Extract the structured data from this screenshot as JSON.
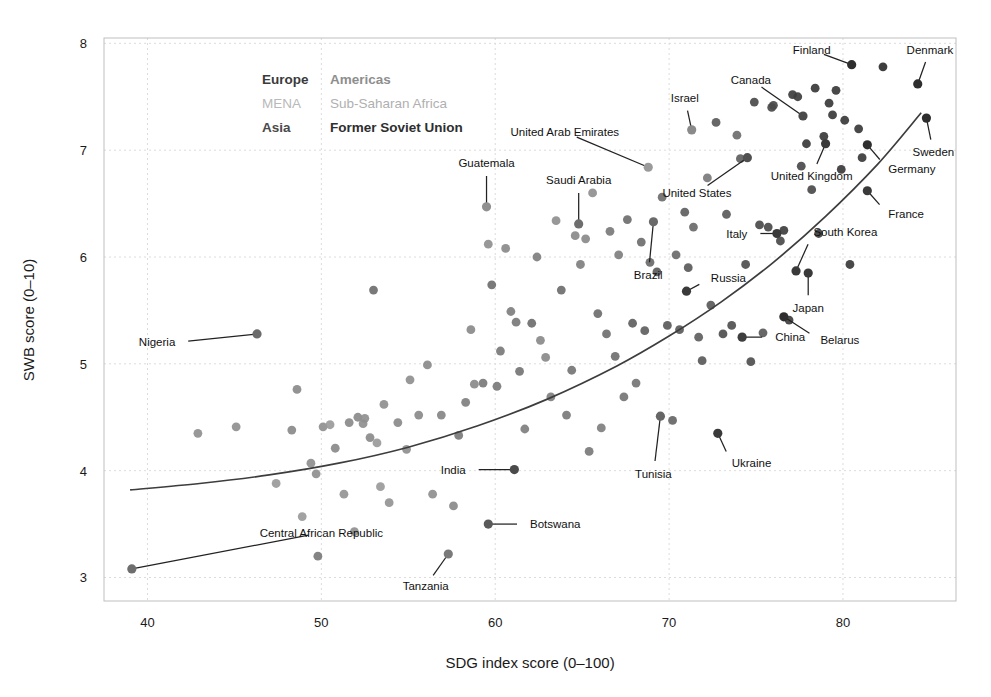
{
  "chart_data": {
    "type": "scatter",
    "title": "",
    "xlabel": "SDG index score (0–100)",
    "ylabel": "SWB score (0–10)",
    "xlim": [
      37.5,
      86.5
    ],
    "ylim": [
      2.78,
      8.05
    ],
    "xticks": [
      40,
      50,
      60,
      70,
      80
    ],
    "yticks": [
      3,
      4,
      5,
      6,
      7,
      8
    ],
    "grid": true,
    "legend_position": "inside-top-left",
    "legend": [
      {
        "label": "Europe",
        "color": "#3a3a3a"
      },
      {
        "label": "Americas",
        "color": "#8e8e8e"
      },
      {
        "label": "MENA",
        "color": "#b9b9b9"
      },
      {
        "label": "Sub-Saharan Africa",
        "color": "#b0b0b0"
      },
      {
        "label": "Asia",
        "color": "#4a4a4a"
      },
      {
        "label": "Former Soviet Union",
        "color": "#2e2e2e"
      }
    ],
    "trend": {
      "name": "fitted trend curve",
      "color": "#3d3d3d",
      "points": [
        [
          39.0,
          3.82
        ],
        [
          43.0,
          3.88
        ],
        [
          47.0,
          3.96
        ],
        [
          51.0,
          4.07
        ],
        [
          55.0,
          4.22
        ],
        [
          59.0,
          4.42
        ],
        [
          63.0,
          4.67
        ],
        [
          67.0,
          4.98
        ],
        [
          70.0,
          5.26
        ],
        [
          73.0,
          5.58
        ],
        [
          76.0,
          5.95
        ],
        [
          79.0,
          6.38
        ],
        [
          82.0,
          6.87
        ],
        [
          84.5,
          7.35
        ]
      ]
    },
    "labeled_points": [
      {
        "name": "Central African Republic",
        "x": 39.1,
        "y": 3.08,
        "color": "#6e6e6e",
        "label_x": 50.0,
        "label_y": 3.42,
        "anchor": "middle"
      },
      {
        "name": "Nigeria",
        "x": 46.3,
        "y": 5.28,
        "color": "#6b6b6b",
        "label_x": 41.6,
        "label_y": 5.2,
        "anchor": "end"
      },
      {
        "name": "Tanzania",
        "x": 57.3,
        "y": 3.22,
        "color": "#7a7a7a",
        "label_x": 56.0,
        "label_y": 2.92,
        "anchor": "middle"
      },
      {
        "name": "Botswana",
        "x": 59.6,
        "y": 3.5,
        "color": "#5a5a5a",
        "label_x": 62.0,
        "label_y": 3.5,
        "anchor": "start"
      },
      {
        "name": "India",
        "x": 61.1,
        "y": 4.01,
        "color": "#4a4a4a",
        "label_x": 58.3,
        "label_y": 4.01,
        "anchor": "end"
      },
      {
        "name": "Guatemala",
        "x": 59.5,
        "y": 6.47,
        "color": "#909090",
        "label_x": 59.5,
        "label_y": 6.88,
        "anchor": "middle"
      },
      {
        "name": "Saudi Arabia",
        "x": 64.8,
        "y": 6.31,
        "color": "#6e6e6e",
        "label_x": 64.8,
        "label_y": 6.72,
        "anchor": "middle"
      },
      {
        "name": "United Arab Emirates",
        "x": 68.8,
        "y": 6.84,
        "color": "#9a9a9a",
        "label_x": 64.0,
        "label_y": 7.17,
        "anchor": "middle"
      },
      {
        "name": "Israel",
        "x": 71.3,
        "y": 7.19,
        "color": "#8a8a8a",
        "label_x": 70.9,
        "label_y": 7.49,
        "anchor": "middle"
      },
      {
        "name": "United States",
        "x": 74.5,
        "y": 6.93,
        "color": "#505050",
        "label_x": 71.6,
        "label_y": 6.6,
        "anchor": "middle"
      },
      {
        "name": "Brazil",
        "x": 69.1,
        "y": 6.33,
        "color": "#6a6a6a",
        "label_x": 68.8,
        "label_y": 5.83,
        "anchor": "middle"
      },
      {
        "name": "Tunisia",
        "x": 69.5,
        "y": 4.51,
        "color": "#666666",
        "label_x": 69.1,
        "label_y": 3.97,
        "anchor": "middle"
      },
      {
        "name": "Ukraine",
        "x": 72.8,
        "y": 4.35,
        "color": "#3a3a3a",
        "label_x": 73.6,
        "label_y": 4.07,
        "anchor": "start"
      },
      {
        "name": "China",
        "x": 74.2,
        "y": 5.25,
        "color": "#3e3e3e",
        "label_x": 76.1,
        "label_y": 5.25,
        "anchor": "start"
      },
      {
        "name": "Russia",
        "x": 71.0,
        "y": 5.68,
        "color": "#3a3a3a",
        "label_x": 72.4,
        "label_y": 5.8,
        "anchor": "start"
      },
      {
        "name": "Italy",
        "x": 76.2,
        "y": 6.22,
        "color": "#3a3a3a",
        "label_x": 74.5,
        "label_y": 6.22,
        "anchor": "end"
      },
      {
        "name": "South Korea",
        "x": 77.3,
        "y": 5.87,
        "color": "#3a3a3a",
        "label_x": 78.3,
        "label_y": 6.23,
        "anchor": "start"
      },
      {
        "name": "Japan",
        "x": 78.0,
        "y": 5.85,
        "color": "#3a3a3a",
        "label_x": 78.0,
        "label_y": 5.52,
        "anchor": "middle"
      },
      {
        "name": "Belarus",
        "x": 76.6,
        "y": 5.44,
        "color": "#2e2e2e",
        "label_x": 78.7,
        "label_y": 5.22,
        "anchor": "start"
      },
      {
        "name": "Canada",
        "x": 77.7,
        "y": 7.32,
        "color": "#4a4a4a",
        "label_x": 74.7,
        "label_y": 7.66,
        "anchor": "middle"
      },
      {
        "name": "United Kingdom",
        "x": 79.0,
        "y": 7.06,
        "color": "#3a3a3a",
        "label_x": 78.2,
        "label_y": 6.76,
        "anchor": "middle"
      },
      {
        "name": "Finland",
        "x": 80.5,
        "y": 7.8,
        "color": "#2e2e2e",
        "label_x": 78.2,
        "label_y": 7.94,
        "anchor": "middle"
      },
      {
        "name": "Denmark",
        "x": 84.3,
        "y": 7.62,
        "color": "#2e2e2e",
        "label_x": 85.0,
        "label_y": 7.94,
        "anchor": "middle"
      },
      {
        "name": "Sweden",
        "x": 84.8,
        "y": 7.3,
        "color": "#2e2e2e",
        "label_x": 85.2,
        "label_y": 6.98,
        "anchor": "middle"
      },
      {
        "name": "Germany",
        "x": 81.4,
        "y": 7.05,
        "color": "#2e2e2e",
        "label_x": 82.6,
        "label_y": 6.82,
        "anchor": "start"
      },
      {
        "name": "France",
        "x": 81.4,
        "y": 6.62,
        "color": "#3a3a3a",
        "label_x": 82.6,
        "label_y": 6.4,
        "anchor": "start"
      }
    ],
    "points": [
      {
        "x": 42.9,
        "y": 4.35,
        "color": "#8f8f8f"
      },
      {
        "x": 45.1,
        "y": 4.41,
        "color": "#8f8f8f"
      },
      {
        "x": 47.4,
        "y": 3.88,
        "color": "#9a9a9a"
      },
      {
        "x": 48.3,
        "y": 4.38,
        "color": "#8a8a8a"
      },
      {
        "x": 48.6,
        "y": 4.76,
        "color": "#8a8a8a"
      },
      {
        "x": 48.9,
        "y": 3.57,
        "color": "#9a9a9a"
      },
      {
        "x": 49.4,
        "y": 4.07,
        "color": "#8f8f8f"
      },
      {
        "x": 49.7,
        "y": 3.97,
        "color": "#8f8f8f"
      },
      {
        "x": 49.8,
        "y": 3.2,
        "color": "#7a7a7a"
      },
      {
        "x": 50.1,
        "y": 4.41,
        "color": "#8f8f8f"
      },
      {
        "x": 50.5,
        "y": 4.43,
        "color": "#9a9a9a"
      },
      {
        "x": 50.8,
        "y": 4.21,
        "color": "#8a8a8a"
      },
      {
        "x": 51.3,
        "y": 3.78,
        "color": "#949494"
      },
      {
        "x": 51.6,
        "y": 4.45,
        "color": "#8a8a8a"
      },
      {
        "x": 51.9,
        "y": 3.43,
        "color": "#8f8f8f"
      },
      {
        "x": 52.1,
        "y": 4.5,
        "color": "#8a8a8a"
      },
      {
        "x": 52.4,
        "y": 4.44,
        "color": "#8f8f8f"
      },
      {
        "x": 52.5,
        "y": 4.49,
        "color": "#8f8f8f"
      },
      {
        "x": 52.8,
        "y": 4.31,
        "color": "#8a8a8a"
      },
      {
        "x": 53.0,
        "y": 5.69,
        "color": "#6e6e6e"
      },
      {
        "x": 53.2,
        "y": 4.26,
        "color": "#9a9a9a"
      },
      {
        "x": 53.4,
        "y": 3.85,
        "color": "#9a9a9a"
      },
      {
        "x": 53.6,
        "y": 4.62,
        "color": "#8f8f8f"
      },
      {
        "x": 53.9,
        "y": 3.7,
        "color": "#949494"
      },
      {
        "x": 54.4,
        "y": 4.45,
        "color": "#8a8a8a"
      },
      {
        "x": 54.9,
        "y": 4.2,
        "color": "#8f8f8f"
      },
      {
        "x": 55.1,
        "y": 4.85,
        "color": "#8f8f8f"
      },
      {
        "x": 55.6,
        "y": 4.52,
        "color": "#8a8a8a"
      },
      {
        "x": 56.1,
        "y": 4.99,
        "color": "#8a8a8a"
      },
      {
        "x": 56.4,
        "y": 3.78,
        "color": "#8f8f8f"
      },
      {
        "x": 56.9,
        "y": 4.52,
        "color": "#858585"
      },
      {
        "x": 57.6,
        "y": 3.67,
        "color": "#8a8a8a"
      },
      {
        "x": 57.9,
        "y": 4.33,
        "color": "#7a7a7a"
      },
      {
        "x": 58.3,
        "y": 4.64,
        "color": "#7f7f7f"
      },
      {
        "x": 58.6,
        "y": 5.32,
        "color": "#8a8a8a"
      },
      {
        "x": 58.8,
        "y": 4.81,
        "color": "#8a8a8a"
      },
      {
        "x": 59.3,
        "y": 4.82,
        "color": "#7a7a7a"
      },
      {
        "x": 59.6,
        "y": 6.12,
        "color": "#8f8f8f"
      },
      {
        "x": 59.8,
        "y": 5.74,
        "color": "#6e6e6e"
      },
      {
        "x": 60.1,
        "y": 4.79,
        "color": "#7a7a7a"
      },
      {
        "x": 60.3,
        "y": 5.12,
        "color": "#7a7a7a"
      },
      {
        "x": 60.6,
        "y": 6.08,
        "color": "#8a8a8a"
      },
      {
        "x": 60.9,
        "y": 5.49,
        "color": "#7f7f7f"
      },
      {
        "x": 61.2,
        "y": 5.39,
        "color": "#7a7a7a"
      },
      {
        "x": 61.4,
        "y": 4.93,
        "color": "#757575"
      },
      {
        "x": 61.7,
        "y": 4.39,
        "color": "#7f7f7f"
      },
      {
        "x": 62.1,
        "y": 5.38,
        "color": "#6e6e6e"
      },
      {
        "x": 62.4,
        "y": 6.0,
        "color": "#7f7f7f"
      },
      {
        "x": 62.6,
        "y": 5.22,
        "color": "#8a8a8a"
      },
      {
        "x": 62.9,
        "y": 5.06,
        "color": "#8a8a8a"
      },
      {
        "x": 63.2,
        "y": 4.69,
        "color": "#7f7f7f"
      },
      {
        "x": 63.5,
        "y": 6.34,
        "color": "#8f8f8f"
      },
      {
        "x": 63.8,
        "y": 5.69,
        "color": "#6e6e6e"
      },
      {
        "x": 64.1,
        "y": 4.52,
        "color": "#7a7a7a"
      },
      {
        "x": 64.4,
        "y": 4.94,
        "color": "#757575"
      },
      {
        "x": 64.6,
        "y": 6.2,
        "color": "#8a8a8a"
      },
      {
        "x": 64.9,
        "y": 5.93,
        "color": "#7f7f7f"
      },
      {
        "x": 65.2,
        "y": 6.17,
        "color": "#8a8a8a"
      },
      {
        "x": 65.4,
        "y": 4.18,
        "color": "#7a7a7a"
      },
      {
        "x": 65.6,
        "y": 6.6,
        "color": "#8f8f8f"
      },
      {
        "x": 65.9,
        "y": 5.47,
        "color": "#6e6e6e"
      },
      {
        "x": 66.1,
        "y": 4.4,
        "color": "#7f7f7f"
      },
      {
        "x": 66.4,
        "y": 5.28,
        "color": "#707070"
      },
      {
        "x": 66.6,
        "y": 6.24,
        "color": "#7a7a7a"
      },
      {
        "x": 66.9,
        "y": 5.07,
        "color": "#707070"
      },
      {
        "x": 67.1,
        "y": 6.02,
        "color": "#7f7f7f"
      },
      {
        "x": 67.4,
        "y": 4.69,
        "color": "#757575"
      },
      {
        "x": 67.6,
        "y": 6.35,
        "color": "#6e6e6e"
      },
      {
        "x": 67.9,
        "y": 5.38,
        "color": "#5f5f5f"
      },
      {
        "x": 68.1,
        "y": 4.82,
        "color": "#757575"
      },
      {
        "x": 68.4,
        "y": 6.14,
        "color": "#6e6e6e"
      },
      {
        "x": 68.6,
        "y": 5.31,
        "color": "#5f5f5f"
      },
      {
        "x": 68.9,
        "y": 5.95,
        "color": "#6a6a6a"
      },
      {
        "x": 69.3,
        "y": 5.86,
        "color": "#5a5a5a"
      },
      {
        "x": 69.6,
        "y": 6.56,
        "color": "#6e6e6e"
      },
      {
        "x": 69.9,
        "y": 5.36,
        "color": "#5a5a5a"
      },
      {
        "x": 70.2,
        "y": 4.47,
        "color": "#666666"
      },
      {
        "x": 70.4,
        "y": 6.02,
        "color": "#6a6a6a"
      },
      {
        "x": 70.6,
        "y": 5.32,
        "color": "#5a5a5a"
      },
      {
        "x": 70.9,
        "y": 6.42,
        "color": "#5f5f5f"
      },
      {
        "x": 71.1,
        "y": 5.9,
        "color": "#5a5a5a"
      },
      {
        "x": 71.4,
        "y": 6.28,
        "color": "#6a6a6a"
      },
      {
        "x": 71.7,
        "y": 5.25,
        "color": "#5f5f5f"
      },
      {
        "x": 71.9,
        "y": 5.03,
        "color": "#5a5a5a"
      },
      {
        "x": 72.2,
        "y": 6.74,
        "color": "#7a7a7a"
      },
      {
        "x": 72.4,
        "y": 5.55,
        "color": "#5a5a5a"
      },
      {
        "x": 72.7,
        "y": 7.26,
        "color": "#5a5a5a"
      },
      {
        "x": 73.1,
        "y": 5.28,
        "color": "#4f4f4f"
      },
      {
        "x": 73.3,
        "y": 6.4,
        "color": "#5a5a5a"
      },
      {
        "x": 73.6,
        "y": 5.36,
        "color": "#4f4f4f"
      },
      {
        "x": 73.9,
        "y": 7.14,
        "color": "#6e6e6e"
      },
      {
        "x": 74.1,
        "y": 6.92,
        "color": "#5f5f5f"
      },
      {
        "x": 74.4,
        "y": 5.93,
        "color": "#4f4f4f"
      },
      {
        "x": 74.7,
        "y": 5.02,
        "color": "#4f4f4f"
      },
      {
        "x": 74.9,
        "y": 7.45,
        "color": "#4a4a4a"
      },
      {
        "x": 75.2,
        "y": 6.3,
        "color": "#4a4a4a"
      },
      {
        "x": 75.4,
        "y": 5.29,
        "color": "#5a5a5a"
      },
      {
        "x": 75.7,
        "y": 6.28,
        "color": "#4a4a4a"
      },
      {
        "x": 75.9,
        "y": 7.4,
        "color": "#4a4a4a"
      },
      {
        "x": 76.0,
        "y": 7.42,
        "color": "#4a4a4a"
      },
      {
        "x": 76.4,
        "y": 6.15,
        "color": "#4a4a4a"
      },
      {
        "x": 76.6,
        "y": 6.25,
        "color": "#3e3e3e"
      },
      {
        "x": 76.9,
        "y": 5.41,
        "color": "#3e3e3e"
      },
      {
        "x": 77.1,
        "y": 7.52,
        "color": "#3e3e3e"
      },
      {
        "x": 77.4,
        "y": 7.5,
        "color": "#3e3e3e"
      },
      {
        "x": 77.6,
        "y": 6.85,
        "color": "#4a4a4a"
      },
      {
        "x": 77.9,
        "y": 7.06,
        "color": "#3a3a3a"
      },
      {
        "x": 78.2,
        "y": 6.63,
        "color": "#4a4a4a"
      },
      {
        "x": 78.4,
        "y": 7.58,
        "color": "#3a3a3a"
      },
      {
        "x": 78.6,
        "y": 6.22,
        "color": "#3e3e3e"
      },
      {
        "x": 78.9,
        "y": 7.13,
        "color": "#3a3a3a"
      },
      {
        "x": 79.2,
        "y": 7.44,
        "color": "#3a3a3a"
      },
      {
        "x": 79.4,
        "y": 7.33,
        "color": "#3a3a3a"
      },
      {
        "x": 79.6,
        "y": 7.56,
        "color": "#3a3a3a"
      },
      {
        "x": 79.9,
        "y": 6.82,
        "color": "#3a3a3a"
      },
      {
        "x": 80.1,
        "y": 7.28,
        "color": "#3a3a3a"
      },
      {
        "x": 80.4,
        "y": 5.93,
        "color": "#3a3a3a"
      },
      {
        "x": 80.9,
        "y": 7.2,
        "color": "#3a3a3a"
      },
      {
        "x": 81.1,
        "y": 6.93,
        "color": "#3a3a3a"
      },
      {
        "x": 82.3,
        "y": 7.78,
        "color": "#2e2e2e"
      }
    ]
  }
}
